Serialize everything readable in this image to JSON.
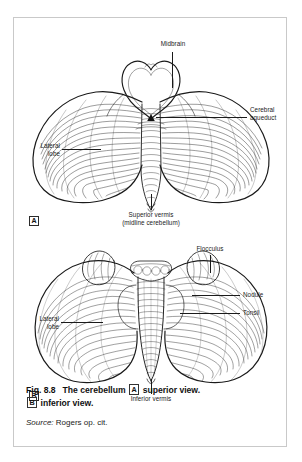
{
  "figure": {
    "number": "Fig. 8.8",
    "title": "The cerebellum",
    "marker_a": "A",
    "marker_b": "B",
    "view_a": "superior view.",
    "view_b": "inferior view.",
    "source_prefix": "Source:",
    "source_text": "Rogers op. cit."
  },
  "panel_a": {
    "marker": "A",
    "labels": {
      "midbrain": "Midbrain",
      "cerebral_aqueduct_l1": "Cerebral",
      "cerebral_aqueduct_l2": "aqueduct",
      "lateral_lobe_l1": "Lateral",
      "lateral_lobe_l2": "lobe",
      "superior_vermis_l1": "Superior vermis",
      "superior_vermis_l2": "(midline cerebellum)",
      "aqueduct_glyph": "▲"
    }
  },
  "panel_b": {
    "marker": "B",
    "labels": {
      "flocculus": "Flocculus",
      "nodule": "Nodule",
      "tonsil": "Tonsil",
      "lateral_lobe_l1": "Lateral",
      "lateral_lobe_l2": "lobe",
      "inferior_vermis": "Inferior vermis"
    }
  },
  "colors": {
    "ink": "#1a1a1a",
    "border": "#c9c9c9",
    "paper": "#ffffff"
  }
}
